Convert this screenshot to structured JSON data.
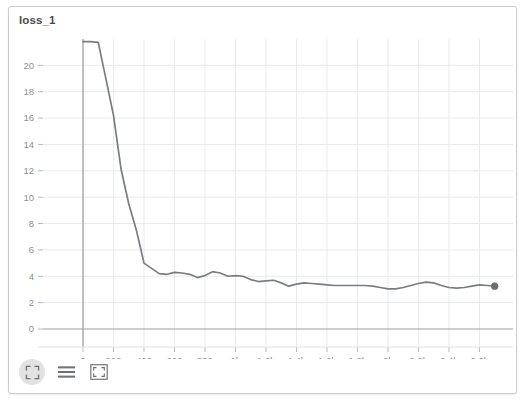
{
  "panel": {
    "title": "loss_1",
    "border_color": "#c9cbcd",
    "background": "#ffffff"
  },
  "toolbar": {
    "buttons": [
      {
        "name": "expand-corners-icon",
        "label": "Fullscreen",
        "active": true
      },
      {
        "name": "lines-icon",
        "label": "Table view",
        "active": false
      },
      {
        "name": "fit-box-icon",
        "label": "Fit to view",
        "active": false
      }
    ]
  },
  "chart_data": {
    "type": "line",
    "title": "loss_1",
    "xlabel": "",
    "ylabel": "",
    "grid": true,
    "legend": null,
    "line_color": "#7a7d80",
    "marker_color": "#6b6e71",
    "axis_color": "#9a9da0",
    "grid_color": "#e8eaec",
    "xlim": [
      -120,
      2820
    ],
    "ylim": [
      -2.2,
      22.0
    ],
    "yticks": [
      0,
      2,
      4,
      6,
      8,
      10,
      12,
      14,
      16,
      18,
      20
    ],
    "ytick_labels": [
      "0",
      "2",
      "4",
      "6",
      "8",
      "10",
      "12",
      "14",
      "16",
      "18",
      "20"
    ],
    "xticks": [
      0,
      200,
      400,
      600,
      800,
      1000,
      1200,
      1400,
      1600,
      1800,
      2000,
      2200,
      2400,
      2600
    ],
    "xtick_labels": [
      "0",
      "200",
      "400",
      "600",
      "800",
      "1k",
      "1.2k",
      "1.4k",
      "1.6k",
      "1.8k",
      "2k",
      "2.2k",
      "2.4k",
      "2.6k"
    ],
    "clipped_top": true,
    "end_marker": {
      "x": 2700,
      "y": 3.25
    },
    "series": [
      {
        "name": "loss_1",
        "x": [
          0,
          50,
          100,
          150,
          200,
          250,
          300,
          350,
          400,
          450,
          500,
          550,
          600,
          650,
          700,
          750,
          800,
          850,
          900,
          950,
          1000,
          1050,
          1100,
          1150,
          1200,
          1250,
          1300,
          1350,
          1400,
          1450,
          1500,
          1550,
          1600,
          1650,
          1700,
          1750,
          1800,
          1850,
          1900,
          1950,
          2000,
          2050,
          2100,
          2150,
          2200,
          2250,
          2300,
          2350,
          2400,
          2450,
          2500,
          2550,
          2600,
          2650,
          2700
        ],
        "values": [
          21.8,
          21.8,
          21.75,
          19.0,
          16.2,
          12.1,
          9.5,
          7.5,
          5.0,
          4.6,
          4.2,
          4.15,
          4.3,
          4.25,
          4.15,
          3.9,
          4.05,
          4.35,
          4.25,
          4.0,
          4.05,
          4.0,
          3.75,
          3.6,
          3.65,
          3.7,
          3.5,
          3.25,
          3.4,
          3.5,
          3.45,
          3.4,
          3.35,
          3.3,
          3.3,
          3.3,
          3.3,
          3.3,
          3.25,
          3.15,
          3.05,
          3.05,
          3.15,
          3.3,
          3.45,
          3.55,
          3.5,
          3.3,
          3.15,
          3.1,
          3.15,
          3.25,
          3.35,
          3.3,
          3.25
        ]
      }
    ]
  }
}
